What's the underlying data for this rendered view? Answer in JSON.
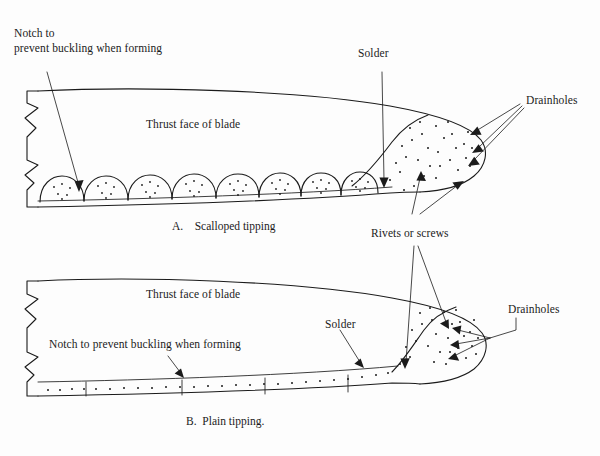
{
  "figure": {
    "kind": "technical-line-drawing",
    "ink_color": "#1b1b1b",
    "background_color": "#fdfdfd"
  },
  "panel_a": {
    "caption": "A.    Scalloped tipping",
    "callouts": {
      "notch_line1": "Notch to",
      "notch_line2": "prevent buckling when forming",
      "thrust_face": "Thrust face of blade",
      "solder": "Solder",
      "drainholes": "Drainholes",
      "rivets": "Rivets or screws"
    }
  },
  "panel_b": {
    "caption": "B.  Plain tipping.",
    "callouts": {
      "thrust_face": "Thrust face of blade",
      "notch": "Notch to prevent buckling when forming",
      "solder": "Solder",
      "drainholes": "Drainholes"
    }
  }
}
